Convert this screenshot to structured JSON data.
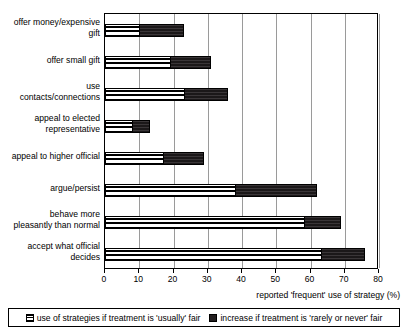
{
  "chart_data": {
    "type": "bar",
    "orientation": "horizontal",
    "stacked": true,
    "title": "",
    "subtitle": "",
    "xlabel": "reported 'frequent' use of strategy (%)",
    "ylabel": "",
    "xlim": [
      0,
      80
    ],
    "xticks": [
      0,
      10,
      20,
      30,
      40,
      50,
      60,
      70,
      80
    ],
    "xtick_labels": [
      "0",
      "10",
      "20",
      "30",
      "40",
      "50",
      "60",
      "70",
      "80"
    ],
    "grid": "vertical",
    "legend_position": "bottom",
    "categories": [
      "offer money/expensive gift",
      "offer small gift",
      "use contacts/connections",
      "appeal to elected representative",
      "appeal to higher official",
      "argue/persist",
      "behave more pleasantly than normal",
      "accept what official decides"
    ],
    "category_labels": [
      [
        "offer money/expensive",
        "gift"
      ],
      [
        "offer small gift"
      ],
      [
        "use",
        "contacts/connections"
      ],
      [
        "appeal to elected",
        "representative"
      ],
      [
        "appeal to higher official"
      ],
      [
        "argue/persist"
      ],
      [
        "behave more",
        "pleasantly than normal"
      ],
      [
        "accept what official",
        "decides"
      ]
    ],
    "series": [
      {
        "name": "use of strategies if treatment is 'usually' fair",
        "key": "base",
        "color": "#ffffff",
        "pattern": "horizontal-lines",
        "values": [
          10,
          19,
          23,
          8,
          17,
          38,
          58,
          63
        ]
      },
      {
        "name": "increase if treatment is 'rarely or never' fair",
        "key": "increase",
        "color": "#231f20",
        "pattern": "solid-dark",
        "values": [
          13,
          12,
          13,
          5,
          12,
          24,
          11,
          13
        ]
      }
    ],
    "totals": [
      23,
      31,
      36,
      13,
      29,
      62,
      69,
      76
    ]
  },
  "legend": {
    "items": [
      {
        "label": "use of strategies if treatment is 'usually' fair",
        "swatch": "base-swatch-icon"
      },
      {
        "label": "increase if treatment is 'rarely or never' fair",
        "swatch": "increase-swatch-icon"
      }
    ]
  }
}
